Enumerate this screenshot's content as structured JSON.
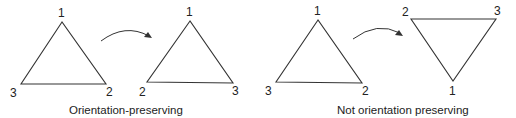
{
  "figure": {
    "panels": [
      {
        "caption": "Orientation-preserving",
        "before": {
          "vertices": [
            {
              "label": "1",
              "position": "top"
            },
            {
              "label": "3",
              "position": "bottom-left"
            },
            {
              "label": "2",
              "position": "bottom-right"
            }
          ]
        },
        "after": {
          "vertices": [
            {
              "label": "1",
              "position": "top"
            },
            {
              "label": "2",
              "position": "bottom-left"
            },
            {
              "label": "3",
              "position": "bottom-right"
            }
          ]
        }
      },
      {
        "caption": "Not orientation preserving",
        "before": {
          "vertices": [
            {
              "label": "1",
              "position": "top"
            },
            {
              "label": "3",
              "position": "bottom-left"
            },
            {
              "label": "2",
              "position": "bottom-right"
            }
          ]
        },
        "after": {
          "vertices": [
            {
              "label": "2",
              "position": "top-left"
            },
            {
              "label": "3",
              "position": "top-right"
            },
            {
              "label": "1",
              "position": "bottom"
            }
          ]
        }
      }
    ],
    "colors": {
      "stroke": "#333333",
      "text": "#222222",
      "background": "#ffffff"
    }
  }
}
